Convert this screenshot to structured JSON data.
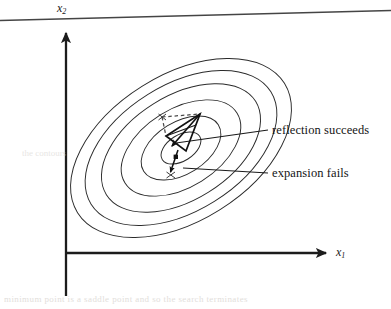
{
  "figure": {
    "kind": "contour-simplex-diagram",
    "axes": {
      "x_axis_label": "x",
      "x_axis_subscript": "1",
      "y_axis_label": "x",
      "y_axis_subscript": "2",
      "origin": [
        66,
        253
      ],
      "x_axis_end": [
        334,
        253
      ],
      "y_axis_top": [
        66,
        26
      ],
      "arrowheads": [
        "right",
        "up"
      ],
      "line_color": "#1c1c1c"
    },
    "annotations": [
      {
        "name": "reflection-label",
        "text": "reflection succeeds",
        "anchor": [
          272,
          130
        ],
        "leader_from": [
          176,
          143
        ]
      },
      {
        "name": "expansion-label",
        "text": "expansion fails",
        "anchor": [
          272,
          173
        ],
        "leader_from": [
          183,
          168
        ]
      }
    ],
    "contours": {
      "count": 6,
      "center": [
        181,
        148
      ],
      "rotation_deg": -32,
      "semi_axes": [
        [
          22,
          13
        ],
        [
          44,
          26
        ],
        [
          66,
          39
        ],
        [
          88,
          52
        ],
        [
          106,
          63
        ],
        [
          122,
          73
        ]
      ],
      "stroke": "#2a2a2a",
      "stroke_width": 0.9,
      "filled": false
    },
    "simplex": {
      "solid_vertices": [
        [
          200,
          114
        ],
        [
          166,
          136
        ],
        [
          186,
          151
        ]
      ],
      "dashed_vertices": [
        [
          162,
          117
        ],
        [
          200,
          114
        ],
        [
          166,
          136
        ]
      ],
      "reflection_arrow": {
        "from": [
          200,
          114
        ],
        "to": [
          171,
          147
        ]
      },
      "expansion_arrow": {
        "from": [
          177,
          152
        ],
        "to": [
          170,
          174
        ]
      },
      "point_marker": [
        176,
        157
      ],
      "tick_marks": [
        [
          162,
          117
        ],
        [
          171,
          175
        ]
      ],
      "solid_stroke": "#111111",
      "dashed_stroke": "#4a4a4a"
    },
    "scan_artifacts": {
      "top_rule": {
        "from": [
          0,
          20
        ],
        "to": [
          391,
          10
        ],
        "color": "#4a4a4a"
      },
      "bleed_text_bottom": "minimum point is a saddle point and so the search terminates",
      "bleed_text_mid": "the contours"
    },
    "colors": {
      "background": "#ffffff",
      "ink": "#1a1a1a",
      "contour": "#2a2a2a",
      "ghost": "#c9c4bd"
    }
  }
}
